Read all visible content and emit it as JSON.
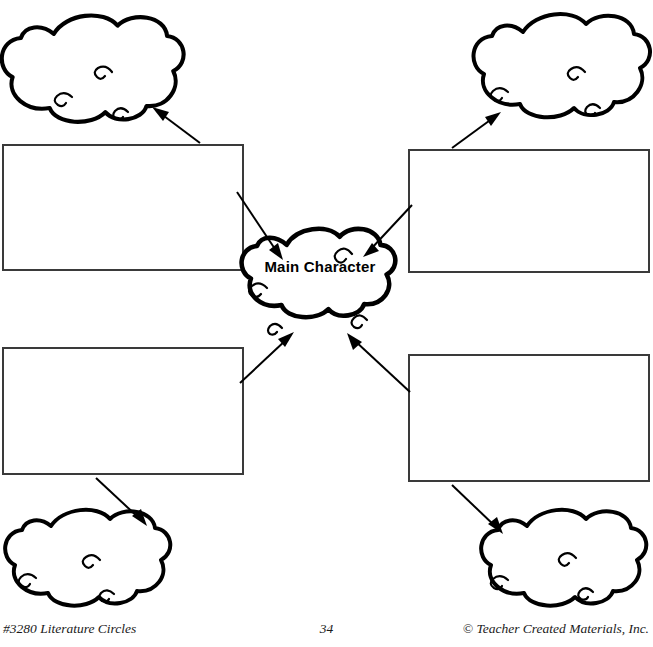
{
  "worksheet": {
    "title": "Main Character",
    "center_node": {
      "label": "Main Character",
      "shape": "cloud"
    },
    "branches": [
      {
        "id": "top-left",
        "box_label": "",
        "box_placeholder": "",
        "cloud_label": "",
        "cloud_placeholder": "",
        "arrow_from": "box",
        "arrow_to": "cloud"
      },
      {
        "id": "top-right",
        "box_label": "",
        "box_placeholder": "",
        "cloud_label": "",
        "cloud_placeholder": "",
        "arrow_from": "box",
        "arrow_to": "cloud"
      },
      {
        "id": "bottom-left",
        "box_label": "",
        "box_placeholder": "",
        "cloud_label": "",
        "cloud_placeholder": "",
        "arrow_from": "box",
        "arrow_to": "cloud"
      },
      {
        "id": "bottom-right",
        "box_label": "",
        "box_placeholder": "",
        "cloud_label": "",
        "cloud_placeholder": "",
        "arrow_from": "box",
        "arrow_to": "cloud"
      }
    ]
  },
  "footer": {
    "left": "#3280 Literature Circles",
    "page_number": "34",
    "right": "© Teacher Created Materials, Inc."
  },
  "colors": {
    "ink": "#000000",
    "box_border": "#3a3a3a",
    "paper": "#ffffff"
  }
}
